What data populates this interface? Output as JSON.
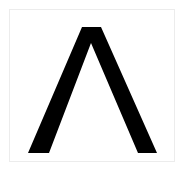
{
  "symbol": {
    "character": "Λ",
    "name": "Greek capital letter lambda",
    "fill_color": "#000000",
    "background_color": "#ffffff",
    "border_color": "#ececec"
  }
}
